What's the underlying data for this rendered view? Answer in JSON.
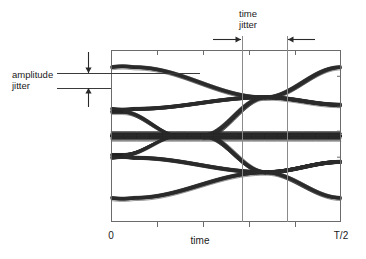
{
  "figure": {
    "kind": "eye-diagram"
  },
  "annotations": {
    "amplitude_jitter": {
      "line1": "amplitude",
      "line2": "jitter",
      "text_x": 12,
      "text_y1": 78,
      "text_y2": 89,
      "leader_upper_y": 73,
      "leader_lower_y": 88,
      "leader_x_start": 57,
      "leader_x_end_outer": 111,
      "leader_x_end_inner": 200,
      "arrow_x": 88,
      "arrow_top_y": 52,
      "arrow_bottom_y": 107
    },
    "time_jitter": {
      "line1": "time",
      "line2": "jitter",
      "text_x": 248,
      "text_y1": 17,
      "text_y2": 28,
      "arrow_y": 39,
      "left_arrow_tail_x": 213,
      "left_arrow_head_x": 241,
      "right_arrow_tail_x": 315,
      "right_arrow_head_x": 288,
      "vline_left_x": 242,
      "vline_right_x": 287
    }
  },
  "axes": {
    "x_label": "time",
    "x_label_x": 200,
    "x_label_y": 244,
    "x_min_label": "0",
    "x_min_label_x": 111,
    "x_max_label": "T/2",
    "x_max_label_x": 341,
    "tick_label_y": 239,
    "frame": {
      "x": 111,
      "y": 50,
      "width": 230,
      "height": 172
    },
    "bottom_ticks_x": [
      157,
      203,
      249,
      295
    ],
    "top_ticks_x": [
      157,
      203,
      249,
      295
    ],
    "tick_len": 5
  },
  "chart_data": {
    "type": "line",
    "title": "",
    "xlabel": "time",
    "ylabel": "",
    "xlim": [
      0,
      1
    ],
    "ylim": [
      -1.25,
      1.25
    ],
    "grid": false,
    "legend": null,
    "annotations": [
      "amplitude jitter",
      "time jitter"
    ],
    "x_tick_labels": [
      "0",
      "T/2"
    ],
    "levels": {
      "high": 1.0,
      "mid_high": 0.45,
      "mid": 0.0,
      "mid_low": -0.38,
      "low": -0.9
    },
    "crossing_points": [
      {
        "x": 0.67,
        "y": 0.56
      },
      {
        "x": 0.67,
        "y": -0.53
      }
    ],
    "eye_openings": [
      {
        "center_x": 0.28,
        "center_y": 0.56,
        "half_height": 0.23
      },
      {
        "center_x": 0.28,
        "center_y": -0.53,
        "half_height": 0.21
      }
    ],
    "time_jitter_window": [
      0.57,
      0.765
    ],
    "amplitude_jitter_window": [
      0.84,
      1.0
    ],
    "trace_count": 46,
    "jitter_sigma_x": 0.012,
    "jitter_sigma_y": 0.03,
    "series": [
      {
        "name": "high-hold",
        "start_level": 1.0,
        "end_level": 1.0,
        "transition": false
      },
      {
        "name": "high-to-mid",
        "start_level": 1.0,
        "end_level": 0.45,
        "transition": true
      },
      {
        "name": "mid-dense",
        "start_level": 0.0,
        "end_level": 0.0,
        "transition": false
      },
      {
        "name": "mid-to-low",
        "start_level": 0.0,
        "end_level": -0.9,
        "transition": true
      },
      {
        "name": "low-hold",
        "start_level": -0.9,
        "end_level": -0.9,
        "transition": false
      }
    ]
  }
}
